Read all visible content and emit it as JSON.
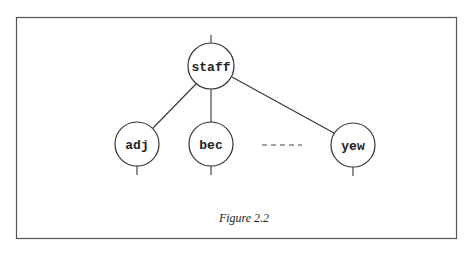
{
  "figure": {
    "caption": "Figure 2.2",
    "frame": {
      "x": 16,
      "y": 17,
      "width": 441,
      "height": 222,
      "color": "#555555"
    },
    "stroke_color": "#333333"
  },
  "tree": {
    "root": {
      "label": "staff",
      "cx": 211,
      "cy": 66,
      "r": 23
    },
    "children": [
      {
        "label": "adj",
        "cx": 137,
        "cy": 144,
        "r": 22
      },
      {
        "label": "bec",
        "cx": 211,
        "cy": 144,
        "r": 22
      },
      {
        "label": "yew",
        "cx": 353,
        "cy": 145,
        "r": 22
      }
    ],
    "ellipsis": {
      "text": "-----",
      "x1": 262,
      "x2": 302,
      "y": 145
    }
  }
}
